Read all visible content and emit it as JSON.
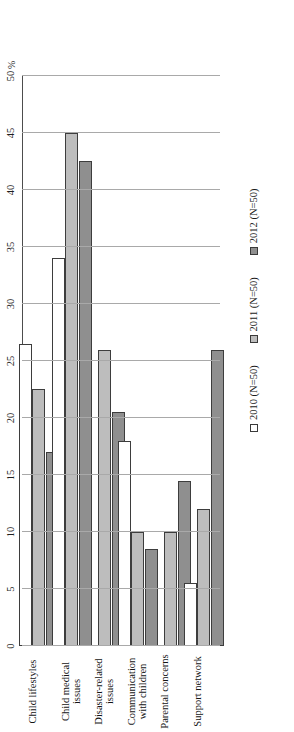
{
  "chart_data": {
    "type": "bar",
    "orientation": "horizontal",
    "title": "",
    "xlabel": "%",
    "ylabel": "",
    "categories": [
      "Child lifestyles",
      "Child medical issues",
      "Disaster-related issues",
      "Communication with children",
      "Parental concerns",
      "Support network"
    ],
    "series": [
      {
        "name": "2010 (N=50)",
        "color": "#ffffff",
        "values": [
          26.5,
          34,
          0,
          18,
          0,
          5.5
        ]
      },
      {
        "name": "2011 (N=50)",
        "color": "#bdbdbd",
        "values": [
          22.5,
          45,
          26,
          10,
          10,
          12
        ]
      },
      {
        "name": "2012 (N=50)",
        "color": "#8f8f8f",
        "values": [
          17,
          42.5,
          20.5,
          8.5,
          14.5,
          26
        ]
      }
    ],
    "xlim": [
      0,
      50
    ],
    "xticks": [
      0,
      5,
      10,
      15,
      20,
      25,
      30,
      35,
      40,
      45,
      50
    ],
    "xtick_labels": [
      "0",
      "5",
      "10",
      "15",
      "20",
      "25",
      "30",
      "35",
      "40",
      "45",
      "50"
    ],
    "grid": true,
    "legend_position": "bottom-right"
  },
  "axis": {
    "unit_label": "%"
  },
  "legend": {
    "items": [
      {
        "label": "2010 (N=50)",
        "swatch": "white-square-swatch"
      },
      {
        "label": "2011 (N=50)",
        "swatch": "light-gray-square-swatch"
      },
      {
        "label": "2012 (N=50)",
        "swatch": "dark-gray-square-swatch"
      }
    ]
  }
}
